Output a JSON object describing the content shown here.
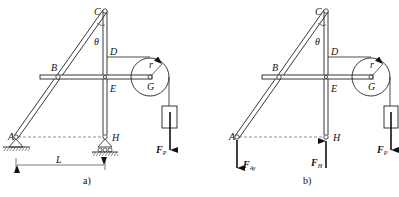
{
  "figure": {
    "panel_a": {
      "caption": "a)",
      "points": {
        "A": "A",
        "B": "B",
        "C": "C",
        "D": "D",
        "E": "E",
        "G": "G",
        "H": "H"
      },
      "angle": "θ",
      "radius": "r",
      "dimension": "L",
      "force": {
        "main": "F",
        "sub": "P"
      }
    },
    "panel_b": {
      "caption": "b)",
      "points": {
        "A": "A",
        "B": "B",
        "C": "C",
        "D": "D",
        "E": "E",
        "G": "G",
        "H": "H"
      },
      "angle": "θ",
      "radius": "r",
      "forces": [
        {
          "main": "F",
          "sub": "Ay"
        },
        {
          "main": "F",
          "sub": "H"
        },
        {
          "main": "F",
          "sub": "P"
        }
      ]
    }
  }
}
